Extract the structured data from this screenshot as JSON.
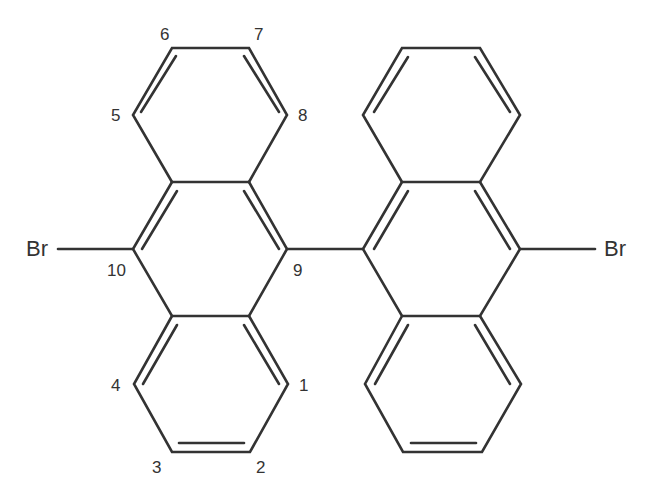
{
  "molecule": {
    "name": "10,10'-dibromo-9,9'-bianthracene",
    "atoms": {
      "br_left": "Br",
      "br_right": "Br"
    },
    "position_labels": {
      "p1": "1",
      "p2": "2",
      "p3": "3",
      "p4": "4",
      "p5": "5",
      "p6": "6",
      "p7": "7",
      "p8": "8",
      "p9": "9",
      "p10": "10"
    },
    "colors": {
      "bond": "#333333",
      "background": "#ffffff"
    }
  }
}
